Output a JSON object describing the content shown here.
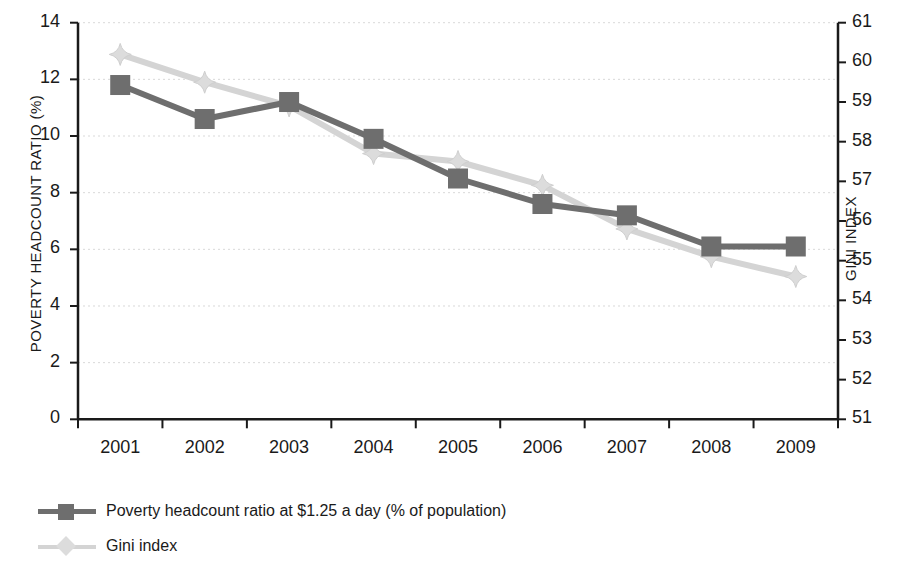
{
  "chart_data": {
    "type": "line",
    "title": "",
    "xlabel": "",
    "categories": [
      "2001",
      "2002",
      "2003",
      "2004",
      "2005",
      "2006",
      "2007",
      "2008",
      "2009"
    ],
    "grid": true,
    "legend_position": "below-left",
    "axes": {
      "left": {
        "label": "POVERTY HEADCOUNT RATIO (%)",
        "ticks": [
          "14",
          "12",
          "10",
          "8",
          "6",
          "4",
          "2",
          "0"
        ],
        "ylim": [
          0,
          14
        ]
      },
      "right": {
        "label": "GINI INDEX",
        "ticks": [
          "61",
          "60",
          "59",
          "58",
          "57",
          "56",
          "55",
          "54",
          "53",
          "52",
          "51"
        ],
        "ylim": [
          51,
          61
        ]
      }
    },
    "series": [
      {
        "name": "Poverty headcount ratio at $1.25 a day (% of population)",
        "axis": "left",
        "color": "#6e6e6e",
        "marker": "square",
        "values": [
          11.8,
          10.6,
          11.2,
          9.9,
          8.5,
          7.6,
          7.2,
          6.1,
          6.1
        ]
      },
      {
        "name": "Gini index",
        "axis": "right",
        "color": "#d4d4d4",
        "marker": "diamond",
        "values": [
          60.2,
          59.5,
          58.9,
          57.7,
          57.5,
          56.9,
          55.8,
          55.1,
          54.6
        ]
      }
    ]
  },
  "legend": {
    "items": [
      {
        "label": "Poverty headcount ratio at $1.25 a day (% of population)"
      },
      {
        "label": "Gini index"
      }
    ]
  },
  "colors": {
    "poverty_series": "#6e6e6e",
    "gini_series": "#d4d4d4",
    "axis": "#1a1a1a",
    "gridline": "#d9d9d9"
  }
}
